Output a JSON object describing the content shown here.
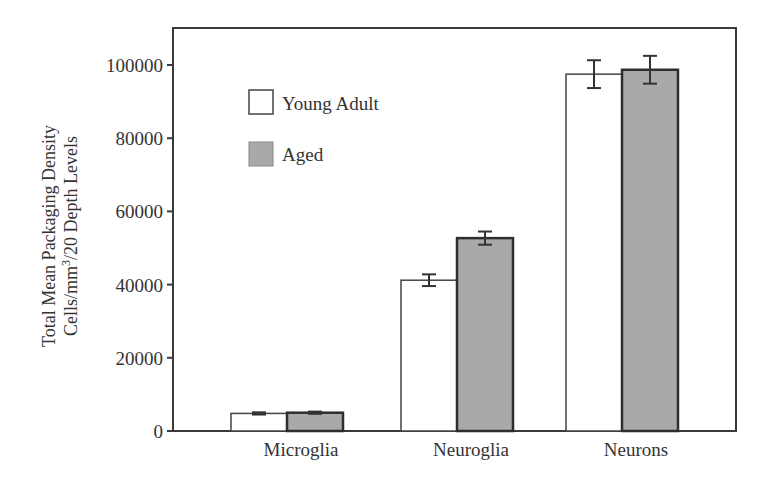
{
  "chart_data": {
    "type": "bar",
    "title": "",
    "xlabel": "",
    "ylabel": "Total Mean Packaging Density Cells/mm³/20 Depth Levels",
    "ylabel_lines": [
      "Total Mean Packaging Density",
      "Cells/mm",
      "3",
      "/20 Depth Levels"
    ],
    "categories": [
      "Microglia",
      "Neuroglia",
      "Neurons"
    ],
    "series": [
      {
        "name": "Young Adult",
        "color": "#ffffff",
        "values": [
          4800,
          41200,
          97500
        ],
        "errors": [
          300,
          1600,
          3800
        ]
      },
      {
        "name": "Aged",
        "color": "#a9a9a9",
        "values": [
          5000,
          52700,
          98700
        ],
        "errors": [
          300,
          1800,
          3800
        ]
      }
    ],
    "ylim": [
      0,
      110000
    ],
    "yticks": [
      0,
      20000,
      40000,
      60000,
      80000,
      100000
    ],
    "ytick_labels": [
      "0",
      "20000",
      "40000",
      "60000",
      "80000",
      "100000"
    ],
    "grid": false,
    "legend_position": "upper-left-inside"
  }
}
